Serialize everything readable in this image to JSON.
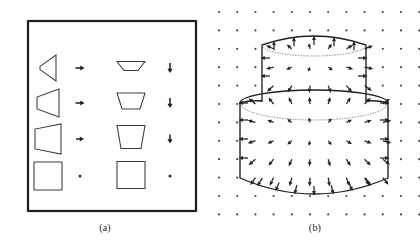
{
  "figure": {
    "background_color": "#ffffff",
    "ink_color": "#1f1f1f",
    "width": 420,
    "height": 244
  },
  "panel_a": {
    "caption": "(a)",
    "frame": {
      "x": 28,
      "y": 21,
      "width": 168,
      "height": 190,
      "stroke": "#1c1c1c"
    },
    "description": "Four rows, each showing a left-facing wedge/trapezoid with a horizontal arrow, and a downward-tapering trapezoid with a vertical arrow.",
    "rows": [
      {
        "label": "row-1",
        "left_shape": {
          "name": "narrow-left-wedge",
          "cx": 48,
          "cy": 68,
          "half_width": 8,
          "half_height": 13,
          "taper": 0.12
        },
        "h_arrow": {
          "name": "short-right-arrow",
          "x": 80,
          "y": 68,
          "length": 9
        },
        "mid_shape": {
          "name": "shallow-trapezoid",
          "cx": 131,
          "cy": 66,
          "top_half": 14,
          "bottom_half": 7,
          "height": 9
        },
        "v_arrow": {
          "name": "short-down-arrow",
          "x": 170,
          "y": 68,
          "length": 10
        }
      },
      {
        "label": "row-2",
        "left_shape": {
          "name": "medium-left-wedge",
          "cx": 48,
          "cy": 103,
          "half_width": 11,
          "half_height": 14,
          "taper": 0.42
        },
        "h_arrow": {
          "name": "short-right-arrow",
          "x": 80,
          "y": 103,
          "length": 9
        },
        "mid_shape": {
          "name": "medium-trapezoid",
          "cx": 131,
          "cy": 101,
          "top_half": 14,
          "bottom_half": 9,
          "height": 16
        },
        "v_arrow": {
          "name": "short-down-arrow",
          "x": 170,
          "y": 103,
          "length": 10
        }
      },
      {
        "label": "row-3",
        "left_shape": {
          "name": "wide-left-wedge",
          "cx": 48,
          "cy": 139,
          "half_width": 13,
          "half_height": 15,
          "taper": 0.66
        },
        "h_arrow": {
          "name": "short-right-arrow",
          "x": 80,
          "y": 139,
          "length": 8
        },
        "mid_shape": {
          "name": "deep-trapezoid",
          "cx": 131,
          "cy": 137,
          "top_half": 14,
          "bottom_half": 10,
          "height": 23
        },
        "v_arrow": {
          "name": "short-down-arrow",
          "x": 170,
          "y": 139,
          "length": 9
        }
      },
      {
        "label": "row-4",
        "left_shape": {
          "name": "square",
          "cx": 48,
          "cy": 176,
          "half_width": 14,
          "half_height": 14,
          "taper": 1.0
        },
        "h_arrow": {
          "name": "zero-length-arrow-dot",
          "x": 80,
          "y": 176,
          "length": 0
        },
        "mid_shape": {
          "name": "square",
          "cx": 131,
          "cy": 175,
          "top_half": 14,
          "bottom_half": 14,
          "height": 27
        },
        "v_arrow": {
          "name": "zero-length-arrow-dot",
          "x": 170,
          "y": 176,
          "length": 0
        }
      }
    ]
  },
  "panel_b": {
    "caption": "(b)",
    "description": "Two-tier barrel / stacked cylinder surface with an outward-pointing vector field sampled on a regular dot grid.",
    "grid": {
      "name": "sample-point-grid",
      "origin_x": 219,
      "origin_y": 12,
      "spacing_x": 18.2,
      "spacing_y": 18.4,
      "cols": 12,
      "rows": 12,
      "dot_radius": 1.1,
      "dot_color": "#4a4a4a"
    },
    "upper_cylinder": {
      "name": "upper-tier",
      "cx": 314,
      "left_x": 262,
      "right_x": 366,
      "top_y": 45,
      "bottom_y": 101,
      "top_bulge": 9,
      "rim_ellipse_ry": 11
    },
    "lower_cylinder": {
      "name": "lower-tier",
      "cx": 314,
      "left_x": 240,
      "right_x": 388,
      "top_y": 97,
      "bottom_y": 178,
      "rim_ellipse_ry": 13,
      "bottom_bulge": 16
    },
    "vector_field": {
      "name": "outward-normal-field",
      "arrow_color": "#1f1f1f",
      "note": "Arrows point radially outward from the body axis; magnitude grows with distance from the axis."
    }
  }
}
